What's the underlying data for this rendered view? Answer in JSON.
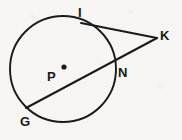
{
  "figure": {
    "background_color": "#f6f5f3",
    "stroke_color": "#1a1a1a",
    "label_color": "#17181a"
  },
  "circle": {
    "name": "circle P",
    "center_label": "P",
    "center_x": 63,
    "center_y": 69,
    "radius": 53,
    "center_dot_x": 64,
    "center_dot_y": 67,
    "center_dot_radius": 2.6
  },
  "labels": [
    {
      "text": "I",
      "x": 78,
      "y": 6,
      "point_name": "tangent-point-i"
    },
    {
      "text": "K",
      "x": 160,
      "y": 29,
      "point_name": "external-point-k"
    },
    {
      "text": "N",
      "x": 118,
      "y": 66,
      "point_name": "secant-point-n"
    },
    {
      "text": "P",
      "x": 47,
      "y": 70,
      "point_name": "center-point-p"
    },
    {
      "text": "G",
      "x": 20,
      "y": 115,
      "point_name": "secant-point-g"
    }
  ],
  "segments": [
    {
      "name": "tangent-segment-ik",
      "from": "I",
      "to": "K",
      "x1": 81,
      "y1": 23,
      "x2": 157,
      "y2": 38
    },
    {
      "name": "secant-segment-gk",
      "from": "G",
      "to": "K",
      "x1": 26,
      "y1": 108,
      "x2": 157,
      "y2": 38
    }
  ],
  "points": {
    "I": {
      "x": 81,
      "y": 23
    },
    "K": {
      "x": 157,
      "y": 38
    },
    "N": {
      "x": 111,
      "y": 64
    },
    "P": {
      "x": 63,
      "y": 69
    },
    "G": {
      "x": 26,
      "y": 108
    }
  }
}
